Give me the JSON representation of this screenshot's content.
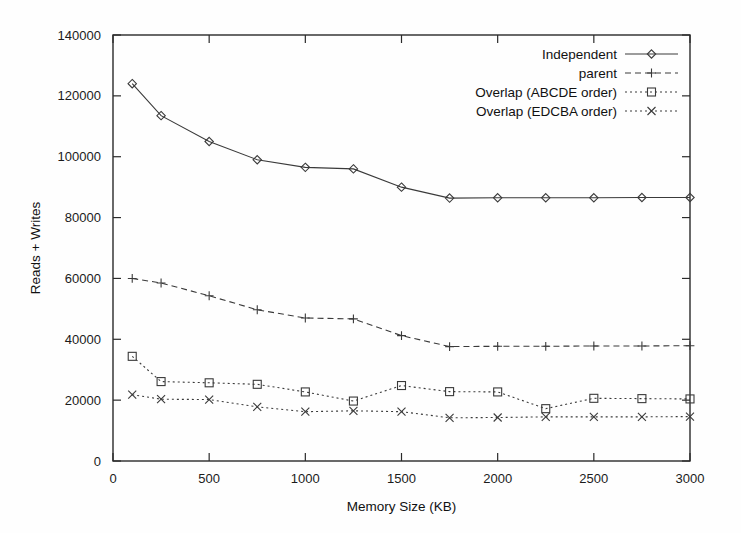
{
  "chart_data": {
    "type": "line",
    "title": "",
    "xlabel": "Memory Size (KB)",
    "ylabel": "Reads + Writes",
    "xlim": [
      0,
      3000
    ],
    "ylim": [
      0,
      140000
    ],
    "xticks": [
      0,
      500,
      1000,
      1500,
      2000,
      2500,
      3000
    ],
    "xtick_labels": [
      "0",
      "500",
      "1000",
      "1500",
      "2000",
      "2500",
      "3000"
    ],
    "yticks": [
      0,
      20000,
      40000,
      60000,
      80000,
      100000,
      120000,
      140000
    ],
    "ytick_labels": [
      "0",
      "20000",
      "40000",
      "60000",
      "80000",
      "100000",
      "120000",
      "140000"
    ],
    "grid": false,
    "legend_position": "top-right",
    "x": [
      100,
      250,
      500,
      750,
      1000,
      1250,
      1500,
      1750,
      2000,
      2250,
      2500,
      2750,
      3000
    ],
    "series": [
      {
        "name": "Independent",
        "marker": "diamond",
        "linestyle": "solid",
        "color": "#3a3a3a",
        "values": [
          124000,
          113500,
          105000,
          99000,
          96500,
          96000,
          90000,
          86400,
          86500,
          86500,
          86500,
          86600,
          86600
        ]
      },
      {
        "name": "parent",
        "marker": "plus",
        "linestyle": "dashed",
        "color": "#3a3a3a",
        "values": [
          60000,
          58500,
          54300,
          49700,
          47000,
          46700,
          41200,
          37600,
          37700,
          37700,
          37800,
          37800,
          37900
        ]
      },
      {
        "name": "Overlap (ABCDE order)",
        "marker": "square",
        "linestyle": "dotted",
        "color": "#3a3a3a",
        "values": [
          34400,
          26100,
          25700,
          25200,
          22700,
          19700,
          24800,
          22800,
          22700,
          17200,
          20600,
          20500,
          20400
        ]
      },
      {
        "name": "Overlap (EDCBA order)",
        "marker": "cross",
        "linestyle": "dotted",
        "color": "#3a3a3a",
        "values": [
          21800,
          20300,
          20200,
          17800,
          16200,
          16500,
          16200,
          14200,
          14300,
          14500,
          14500,
          14500,
          14600
        ]
      }
    ]
  }
}
